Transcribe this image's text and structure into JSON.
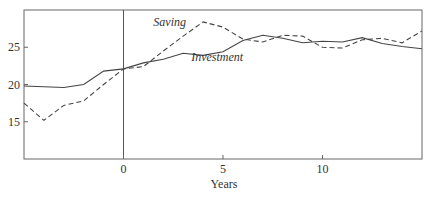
{
  "chart_data": {
    "type": "line",
    "title": "",
    "xlabel": "Years",
    "ylabel": "",
    "xlim": [
      -5,
      15
    ],
    "ylim": [
      10,
      30
    ],
    "x_ticks": [
      0,
      5,
      10
    ],
    "x_tick_labels": [
      "0",
      "5",
      "10"
    ],
    "y_ticks": [
      15,
      20,
      25
    ],
    "y_tick_labels": [
      "15",
      "20",
      "25"
    ],
    "grid": false,
    "legend": "inline labels",
    "vertical_reference_line_x": 0,
    "x": [
      -5,
      -4,
      -3,
      -2,
      -1,
      0,
      1,
      2,
      3,
      4,
      5,
      6,
      7,
      8,
      9,
      10,
      11,
      12,
      13,
      14,
      15
    ],
    "series": [
      {
        "name": "Saving",
        "style": "dashed",
        "label_position": {
          "x": 1.5,
          "y": 27.8
        },
        "values": [
          17.5,
          15.2,
          17.2,
          17.8,
          20.0,
          22.1,
          22.4,
          24.5,
          26.5,
          28.4,
          27.7,
          26.1,
          25.7,
          26.6,
          26.5,
          25.0,
          24.9,
          26.0,
          26.2,
          25.6,
          27.2
        ]
      },
      {
        "name": "Investment",
        "style": "solid",
        "label_position": {
          "x": 3.4,
          "y": 23.1
        },
        "values": [
          19.8,
          19.7,
          19.6,
          20.0,
          21.8,
          22.1,
          22.9,
          23.4,
          24.2,
          23.9,
          24.4,
          25.9,
          26.6,
          26.2,
          25.6,
          25.8,
          25.7,
          26.3,
          25.5,
          25.1,
          24.8
        ]
      }
    ]
  }
}
